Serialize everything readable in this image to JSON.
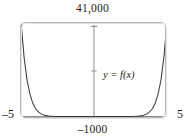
{
  "figure": {
    "function_label": "y = f(x)",
    "axis_labels": {
      "y_max": "41,000",
      "y_min": "–1000",
      "x_min": "–5",
      "x_max": "5"
    },
    "colors": {
      "curve": "#3b3b3b",
      "axis": "#8c8c90",
      "frame": "#b9b9bd",
      "background": "#ffffff",
      "text": "#1a1a1a"
    }
  },
  "chart_data": {
    "type": "line",
    "title": "",
    "xlabel": "",
    "ylabel": "",
    "xlim": [
      -5,
      5
    ],
    "ylim": [
      -1000,
      41000
    ],
    "grid": false,
    "legend": "none",
    "annotations": [
      {
        "text": "y = f(x)",
        "x": 1.7,
        "y": 12500
      }
    ],
    "tick_labels": {
      "x": [
        "–5",
        "5"
      ],
      "y": [
        "–1000",
        "41,000"
      ]
    },
    "axes_drawn": {
      "vertical_at_x": 0,
      "horizontal_at_y": 0
    },
    "series": [
      {
        "name": "f(x)",
        "description": "even-symmetric steeply rising curve, near zero on the interior, ascending to about 41,000 at the viewport edges",
        "x": [
          -5.0,
          -4.8,
          -4.6,
          -4.4,
          -4.2,
          -4.0,
          -3.8,
          -3.6,
          -3.4,
          -3.2,
          -3.0,
          -2.8,
          -2.6,
          -2.4,
          -2.2,
          -2.0,
          -1.5,
          -1.0,
          -0.5,
          0.0,
          0.5,
          1.0,
          1.5,
          2.0,
          2.2,
          2.4,
          2.6,
          2.8,
          3.0,
          3.2,
          3.4,
          3.6,
          3.8,
          4.0,
          4.2,
          4.4,
          4.6,
          4.8,
          5.0
        ],
        "y": [
          41000,
          26000,
          16000,
          9800,
          5800,
          3300,
          1900,
          1050,
          560,
          290,
          150,
          80,
          42,
          24,
          14,
          9,
          4,
          2,
          1,
          0,
          1,
          2,
          4,
          9,
          14,
          24,
          42,
          80,
          150,
          290,
          560,
          1050,
          1900,
          3300,
          5800,
          9800,
          16000,
          26000,
          41000
        ]
      }
    ]
  }
}
